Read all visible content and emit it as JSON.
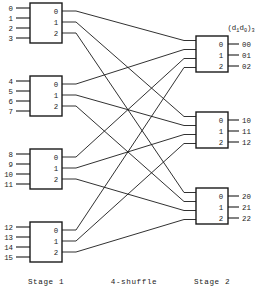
{
  "figure": {
    "title_label": "(d₁d₀)₃",
    "title_main": "(d",
    "title_sub1": "1",
    "title_mid": "d",
    "title_sub2": "0",
    "title_close": ")",
    "title_sub3": "3",
    "bottom_labels": {
      "stage1": "Stage 1",
      "shuffle": "4-shuffle",
      "stage2": "Stage 2"
    },
    "colors": {
      "ink": "#1a1a1a",
      "paper": "#ffffff"
    }
  },
  "stage1": {
    "name": "Stage 1",
    "boxes": [
      {
        "id": "s1-box-0",
        "inputs": [
          "0",
          "1",
          "2",
          "3"
        ],
        "outputs": [
          "0",
          "1",
          "2"
        ],
        "geom": {
          "x": 30,
          "y": 3,
          "w": 32,
          "h": 40
        }
      },
      {
        "id": "s1-box-1",
        "inputs": [
          "4",
          "5",
          "6",
          "7"
        ],
        "outputs": [
          "0",
          "1",
          "2"
        ],
        "geom": {
          "x": 30,
          "y": 76,
          "w": 32,
          "h": 40
        }
      },
      {
        "id": "s1-box-2",
        "inputs": [
          "8",
          "9",
          "10",
          "11"
        ],
        "outputs": [
          "0",
          "1",
          "2"
        ],
        "geom": {
          "x": 30,
          "y": 149,
          "w": 32,
          "h": 40
        }
      },
      {
        "id": "s1-box-3",
        "inputs": [
          "12",
          "13",
          "14",
          "15"
        ],
        "outputs": [
          "0",
          "1",
          "2"
        ],
        "geom": {
          "x": 30,
          "y": 222,
          "w": 32,
          "h": 40
        }
      }
    ]
  },
  "stage2": {
    "name": "Stage 2",
    "boxes": [
      {
        "id": "s2-box-0",
        "ports": [
          "0",
          "1",
          "2"
        ],
        "outputs": [
          "00",
          "01",
          "02"
        ],
        "geom": {
          "x": 196,
          "y": 36,
          "w": 32,
          "h": 36
        }
      },
      {
        "id": "s2-box-1",
        "ports": [
          "0",
          "1",
          "2"
        ],
        "outputs": [
          "10",
          "11",
          "12"
        ],
        "geom": {
          "x": 196,
          "y": 112,
          "w": 32,
          "h": 36
        }
      },
      {
        "id": "s2-box-2",
        "ports": [
          "0",
          "1",
          "2"
        ],
        "outputs": [
          "20",
          "21",
          "22"
        ],
        "geom": {
          "x": 196,
          "y": 188,
          "w": 32,
          "h": 36
        }
      }
    ]
  },
  "shuffle": {
    "name": "4-shuffle",
    "description": "Stage 1 box i output j connects to Stage 2 box j input i",
    "connections": [
      {
        "from_box": 0,
        "from_port": 0,
        "to_box": 0,
        "to_port": 0
      },
      {
        "from_box": 0,
        "from_port": 1,
        "to_box": 1,
        "to_port": 0
      },
      {
        "from_box": 0,
        "from_port": 2,
        "to_box": 2,
        "to_port": 0
      },
      {
        "from_box": 1,
        "from_port": 0,
        "to_box": 0,
        "to_port": 1
      },
      {
        "from_box": 1,
        "from_port": 1,
        "to_box": 1,
        "to_port": 1
      },
      {
        "from_box": 1,
        "from_port": 2,
        "to_box": 2,
        "to_port": 1
      },
      {
        "from_box": 2,
        "from_port": 0,
        "to_box": 0,
        "to_port": 2
      },
      {
        "from_box": 2,
        "from_port": 1,
        "to_box": 1,
        "to_port": 2
      },
      {
        "from_box": 2,
        "from_port": 2,
        "to_box": 2,
        "to_port": 2
      },
      {
        "from_box": 3,
        "from_port": 0,
        "to_box": 0,
        "to_port": 3
      },
      {
        "from_box": 3,
        "from_port": 1,
        "to_box": 1,
        "to_port": 3
      },
      {
        "from_box": 3,
        "from_port": 2,
        "to_box": 2,
        "to_port": 3
      }
    ]
  }
}
